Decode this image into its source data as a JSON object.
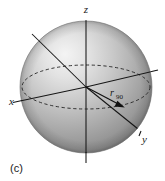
{
  "figure": {
    "caption": "(c)",
    "type": "3d-sphere-coordinate-diagram",
    "background_color": "#ffffff"
  },
  "axes": [
    {
      "id": "z",
      "label": "z",
      "direction": "up",
      "label_x": 86,
      "label_y": 13
    },
    {
      "id": "x",
      "label": "x",
      "direction": "lower-left",
      "label_x": 9,
      "label_y": 105
    },
    {
      "id": "y",
      "label": "y",
      "direction": "lower-right",
      "label_x": 142,
      "label_y": 143
    }
  ],
  "vector": {
    "base_label": "r",
    "subscript": "90",
    "label_x": 112,
    "label_y": 96,
    "sub_x": 118,
    "sub_y": 99
  },
  "sphere": {
    "center_x": 86,
    "center_y": 87,
    "radius": 66,
    "fill_light": "#f2f2f2",
    "fill_mid": "#b9b9b9",
    "fill_dark": "#8d8d8d",
    "fill_edge": "#6e6e6e",
    "equator_style": "dashed",
    "equator_rx": 64,
    "equator_ry": 22
  },
  "colors": {
    "line": "#151515",
    "dashed": "#2b2b2b",
    "text": "#1a1a1a",
    "page": "#ffffff"
  }
}
